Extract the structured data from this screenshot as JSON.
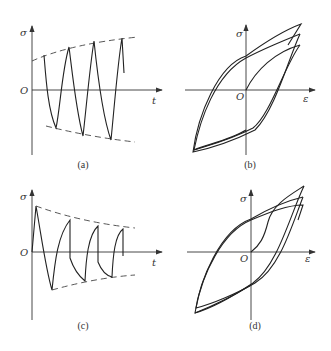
{
  "figure": {
    "panels": [
      {
        "id": "a",
        "caption": "(a)",
        "y_axis_label": "σ",
        "x_axis_label": "t",
        "origin_label": "O",
        "description": "Stress vs time with increasing amplitude (cyclic hardening envelope, dashed)"
      },
      {
        "id": "b",
        "caption": "(b)",
        "y_axis_label": "σ",
        "x_axis_label": "ε",
        "origin_label": "O",
        "description": "Stress-strain hysteresis loops growing (cyclic hardening)"
      },
      {
        "id": "c",
        "caption": "(c)",
        "y_axis_label": "σ",
        "x_axis_label": "t",
        "origin_label": "O",
        "description": "Stress vs time with decreasing amplitude (cyclic softening envelope, dashed)"
      },
      {
        "id": "d",
        "caption": "(d)",
        "y_axis_label": "σ",
        "x_axis_label": "ε",
        "origin_label": "O",
        "description": "Stress-strain hysteresis loops shrinking (cyclic softening)"
      }
    ]
  },
  "colors": {
    "line": "#222222",
    "text": "#333333",
    "background": "#ffffff"
  }
}
